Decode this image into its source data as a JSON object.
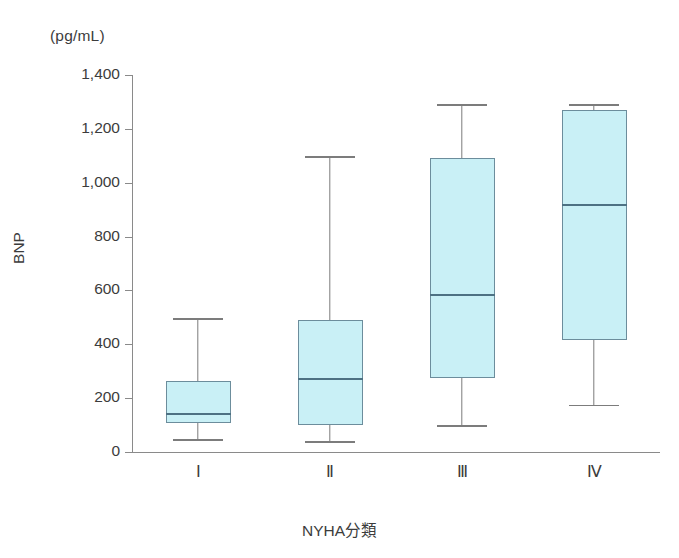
{
  "chart_data": {
    "type": "box",
    "title": "",
    "unit_label": "(pg/mL)",
    "ylabel": "BNP",
    "xlabel": "NYHA分類",
    "ylim": [
      0,
      1400
    ],
    "grid": false,
    "legend": "none",
    "ytick_labels": [
      "1,400",
      "1,200",
      "1,000",
      "800",
      "600",
      "400",
      "200",
      "0"
    ],
    "ytick_values": [
      1400,
      1200,
      1000,
      800,
      600,
      400,
      200,
      0
    ],
    "categories": [
      "Ⅰ",
      "Ⅱ",
      "Ⅲ",
      "Ⅳ"
    ],
    "boxes": [
      {
        "category": "Ⅰ",
        "whisker_low": 48,
        "q1": 108,
        "median": 141,
        "q3": 264,
        "whisker_high": 497
      },
      {
        "category": "Ⅱ",
        "whisker_low": 41,
        "q1": 100,
        "median": 271,
        "q3": 490,
        "whisker_high": 1099
      },
      {
        "category": "Ⅲ",
        "whisker_low": 100,
        "q1": 275,
        "median": 583,
        "q3": 1092,
        "whisker_high": 1292
      },
      {
        "category": "Ⅳ",
        "whisker_low": 175,
        "q1": 416,
        "median": 917,
        "q3": 1270,
        "whisker_high": 1292
      }
    ],
    "colors": {
      "box_fill": "#c9f0f6",
      "box_border": "#6c8d9c",
      "median": "#4d7183",
      "whisker": "#7c7c7c",
      "axis": "#8a8a8a",
      "text": "#3c3c3c"
    }
  }
}
